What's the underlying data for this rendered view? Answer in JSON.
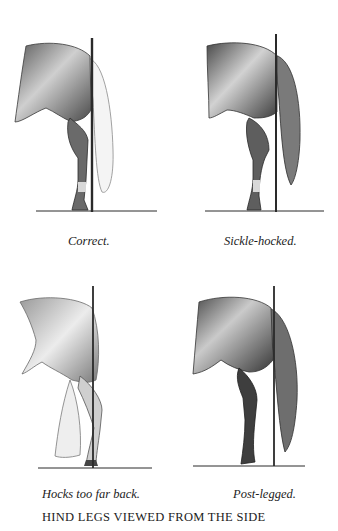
{
  "figure": {
    "title": "HIND LEGS VIEWED FROM THE SIDE",
    "panels": [
      {
        "id": "correct",
        "caption": "Correct."
      },
      {
        "id": "sickle-hocked",
        "caption": "Sickle-hocked."
      },
      {
        "id": "hocks-too-far-back",
        "caption": "Hocks too far back."
      },
      {
        "id": "post-legged",
        "caption": "Post-legged."
      }
    ],
    "colors": {
      "ink": "#2a2a2a",
      "shade": "#6e6e6e",
      "light": "#b5b5b5",
      "background": "#ffffff"
    }
  }
}
